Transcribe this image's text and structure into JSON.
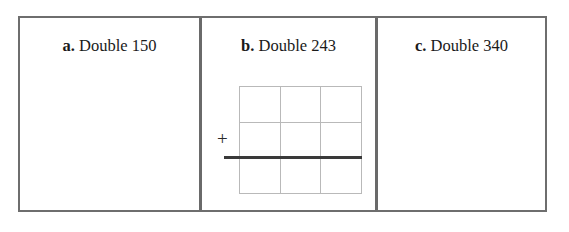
{
  "worksheet": {
    "title": "Doubling practice problems",
    "background_color": "#ffffff",
    "frame_color": "#6e6e6e",
    "divider_color": "#6a6a6a",
    "problems": [
      {
        "id": "a",
        "label": "a.",
        "text": "Double 150",
        "number": 150,
        "has_grid": false
      },
      {
        "id": "b",
        "label": "b.",
        "text": "Double 243",
        "number": 243,
        "has_grid": true
      },
      {
        "id": "c",
        "label": "c.",
        "text": "Double 340",
        "number": 340,
        "has_grid": false
      }
    ]
  },
  "work_area": {
    "operator": "+",
    "operator_name": "plus-sign",
    "grid": {
      "columns": 3,
      "rows": 3,
      "line_color": "#b9b9b9",
      "cells": [
        "",
        "",
        "",
        "",
        "",
        "",
        "",
        "",
        ""
      ]
    },
    "answer_rule": {
      "name": "answer-line",
      "color": "#3a3a3a",
      "thickness_px": 3
    }
  }
}
